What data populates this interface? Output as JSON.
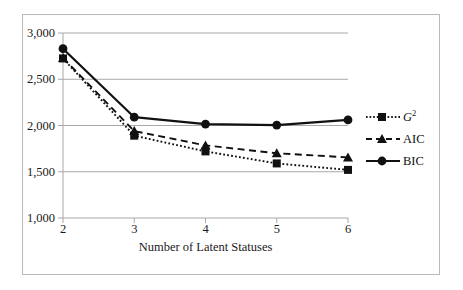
{
  "chart_data": {
    "type": "line",
    "title": "",
    "xlabel": "Number of Latent Statuses",
    "ylabel": "",
    "x": [
      2,
      3,
      4,
      5,
      6
    ],
    "xtick_labels": [
      "2",
      "3",
      "4",
      "5",
      "6"
    ],
    "ytick_labels": [
      "1,000",
      "1,500",
      "2,000",
      "2,500",
      "3,000"
    ],
    "ytick_values": [
      1000,
      1500,
      2000,
      2500,
      3000
    ],
    "ylim": [
      1000,
      3000
    ],
    "grid": "horizontal",
    "legend_position": "right",
    "series": [
      {
        "name": "G2",
        "label_text": "G",
        "label_superscript": "2",
        "values": [
          2725,
          1890,
          1720,
          1590,
          1520
        ],
        "line_style": "dotted",
        "marker": "square",
        "color": "#111111"
      },
      {
        "name": "AIC",
        "label_text": "AIC",
        "label_superscript": "",
        "values": [
          2730,
          1940,
          1785,
          1700,
          1655
        ],
        "line_style": "dashed",
        "marker": "triangle",
        "color": "#111111"
      },
      {
        "name": "BIC",
        "label_text": "BIC",
        "label_superscript": "",
        "values": [
          2830,
          2090,
          2015,
          2005,
          2060
        ],
        "line_style": "solid",
        "marker": "circle",
        "color": "#111111"
      }
    ]
  },
  "axes": {
    "y_ticks": [
      {
        "label": "3,000"
      },
      {
        "label": "2,500"
      },
      {
        "label": "2,000"
      },
      {
        "label": "1,500"
      },
      {
        "label": "1,000"
      }
    ],
    "x_ticks": [
      {
        "label": "2"
      },
      {
        "label": "3"
      },
      {
        "label": "4"
      },
      {
        "label": "5"
      },
      {
        "label": "6"
      }
    ],
    "x_title": "Number of Latent Statuses"
  },
  "legend": {
    "items": [
      {
        "label": "G",
        "superscript": "2",
        "italic": true
      },
      {
        "label": "AIC",
        "superscript": "",
        "italic": false
      },
      {
        "label": "BIC",
        "superscript": "",
        "italic": false
      }
    ]
  },
  "colors": {
    "ink": "#111111",
    "gridline": "#a8a8a8",
    "frame": "#b9b9b9",
    "background": "#ffffff"
  }
}
